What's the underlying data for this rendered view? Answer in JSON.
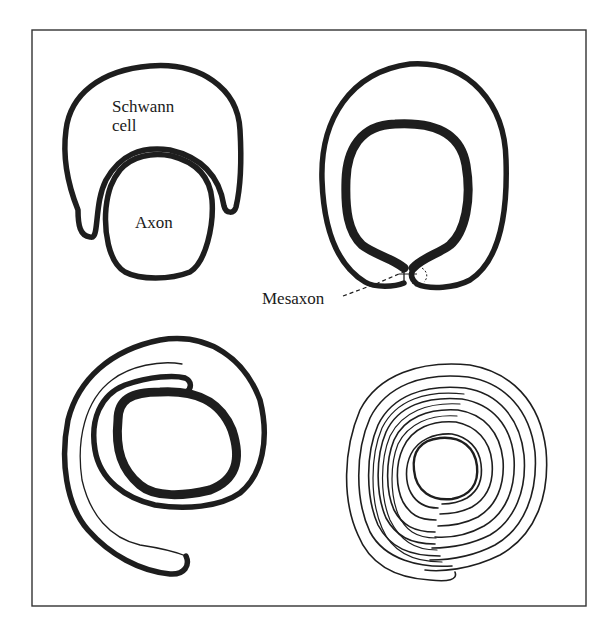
{
  "figure": {
    "labels": {
      "schwann_line1": "Schwann",
      "schwann_line2": "cell",
      "axon": "Axon",
      "mesaxon": "Mesaxon"
    },
    "panels": [
      {
        "id": "stage-1",
        "description": "Schwann cell engulfing axon"
      },
      {
        "id": "stage-2",
        "description": "Axon enclosed; mesaxon formed"
      },
      {
        "id": "stage-3",
        "description": "Schwann cell membrane begins to spiral"
      },
      {
        "id": "stage-4",
        "description": "Compact multilayer myelin sheath"
      }
    ],
    "colors": {
      "line": "#1e1e1e",
      "background": "#ffffff",
      "frame": "#333333"
    }
  }
}
